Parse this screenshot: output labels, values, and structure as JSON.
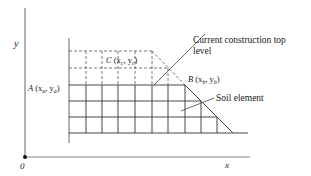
{
  "diagram": {
    "axes": {
      "y_label": "y",
      "x_label": "x",
      "origin_label": "0"
    },
    "points": {
      "A": {
        "name": "A",
        "coords": "(x",
        "sub1": "a",
        "sep": ", y",
        "sub2": "a",
        "close": ")"
      },
      "B": {
        "name": "B",
        "coords": "(x",
        "sub1": "b",
        "sep": ", y",
        "sub2": "b",
        "close": ")"
      },
      "C": {
        "name": "C",
        "coords": "(x",
        "sub1": "c",
        "sep": ", y",
        "sub2": "c",
        "close": ")"
      }
    },
    "annotations": {
      "construction_line1": "Current construction top",
      "construction_line2": "level",
      "soil_element": "Soil element"
    },
    "colors": {
      "line": "#333333",
      "axis": "#555555",
      "text": "#222222"
    }
  }
}
